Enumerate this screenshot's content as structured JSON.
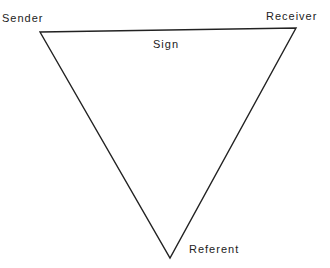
{
  "diagram": {
    "type": "triangle",
    "labels": {
      "sender": "Sender",
      "receiver": "Receiver",
      "sign": "Sign",
      "referent": "Referent"
    },
    "vertices": {
      "sender": [
        40,
        32
      ],
      "receiver": [
        296,
        28
      ],
      "referent": [
        170,
        258
      ]
    },
    "line_color": "#222222"
  }
}
